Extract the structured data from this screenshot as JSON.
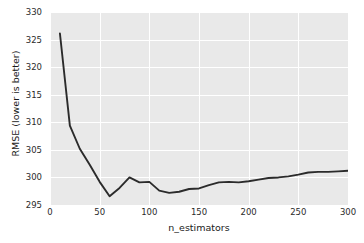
{
  "chart_data": {
    "type": "line",
    "title": "",
    "xlabel": "n_estimators",
    "ylabel": "RMSE (lower is better)",
    "xlim": [
      0,
      300
    ],
    "ylim": [
      295,
      330
    ],
    "xticks": [
      0,
      50,
      100,
      150,
      200,
      250,
      300
    ],
    "yticks": [
      295,
      300,
      305,
      310,
      315,
      320,
      325,
      330
    ],
    "grid": true,
    "legend": "none",
    "line_color": "#2b2b2b",
    "background_color": "#e9e9e9",
    "gridline_color": "#ffffff",
    "series": [
      {
        "name": "RMSE",
        "x": [
          10,
          20,
          30,
          40,
          50,
          60,
          70,
          80,
          90,
          100,
          110,
          120,
          130,
          140,
          150,
          160,
          170,
          180,
          190,
          200,
          210,
          220,
          230,
          240,
          250,
          260,
          270,
          280,
          290,
          300
        ],
        "values": [
          326.1,
          309.4,
          305.2,
          302.3,
          299.2,
          296.6,
          298.1,
          300.0,
          299.1,
          299.2,
          297.6,
          297.2,
          297.4,
          297.9,
          298.0,
          298.6,
          299.1,
          299.2,
          299.1,
          299.3,
          299.6,
          299.9,
          300.0,
          300.2,
          300.5,
          300.9,
          301.0,
          301.0,
          301.1,
          301.2
        ]
      }
    ]
  },
  "axis": {
    "xtick_labels": [
      "0",
      "50",
      "100",
      "150",
      "200",
      "250",
      "300"
    ],
    "ytick_labels": [
      "295",
      "300",
      "305",
      "310",
      "315",
      "320",
      "325",
      "330"
    ],
    "xlabel": "n_estimators",
    "ylabel": "RMSE (lower is better)"
  }
}
